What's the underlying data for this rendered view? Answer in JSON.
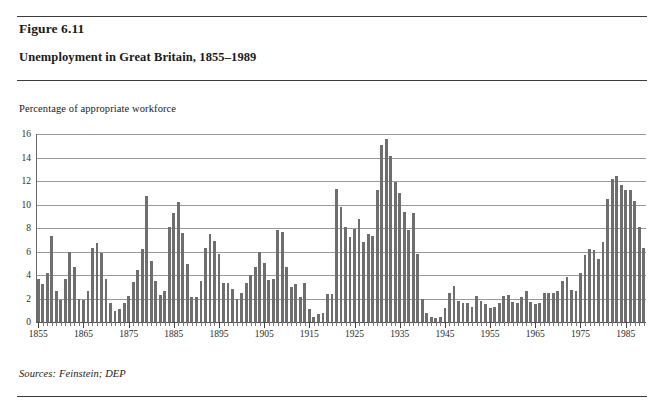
{
  "figure": {
    "number": "Figure 6.11",
    "title": "Unemployment in Great Britain, 1855–1989",
    "axis_note": "Percentage of appropriate workforce",
    "sources": "Sources: Feinstein; DEP"
  },
  "colors": {
    "bar": "#6e6e6e",
    "gridline": "#9a9a9a",
    "rule": "#3b3b3b",
    "text": "#1a1a1a",
    "background": "#ffffff"
  },
  "chart_data": {
    "type": "bar",
    "title": "Unemployment in Great Britain, 1855–1989",
    "subtitle": "Figure 6.11",
    "xlabel": "",
    "ylabel": "Percentage of appropriate workforce",
    "ylim": [
      0,
      16
    ],
    "ytick_step": 2,
    "yticks": [
      0,
      2,
      4,
      6,
      8,
      10,
      12,
      14,
      16
    ],
    "ytick_labels": [
      "0",
      "2",
      "4",
      "6",
      "8",
      "10",
      "12",
      "14",
      "16"
    ],
    "xlim": [
      1855,
      1989
    ],
    "xticks": [
      1855,
      1865,
      1875,
      1885,
      1895,
      1905,
      1915,
      1925,
      1935,
      1945,
      1955,
      1965,
      1975,
      1985
    ],
    "xtick_labels": [
      "1855",
      "1865",
      "1875",
      "1885",
      "1895",
      "1905",
      "1915",
      "1925",
      "1935",
      "1945",
      "1955",
      "1965",
      "1975",
      "1985"
    ],
    "xtick_minor_step": 1,
    "grid": "horizontal",
    "legend": "none",
    "series_name": "Unemployment rate",
    "x": [
      1855,
      1856,
      1857,
      1858,
      1859,
      1860,
      1861,
      1862,
      1863,
      1864,
      1865,
      1866,
      1867,
      1868,
      1869,
      1870,
      1871,
      1872,
      1873,
      1874,
      1875,
      1876,
      1877,
      1878,
      1879,
      1880,
      1881,
      1882,
      1883,
      1884,
      1885,
      1886,
      1887,
      1888,
      1889,
      1890,
      1891,
      1892,
      1893,
      1894,
      1895,
      1896,
      1897,
      1898,
      1899,
      1900,
      1901,
      1902,
      1903,
      1904,
      1905,
      1906,
      1907,
      1908,
      1909,
      1910,
      1911,
      1912,
      1913,
      1914,
      1915,
      1916,
      1917,
      1918,
      1919,
      1920,
      1921,
      1922,
      1923,
      1924,
      1925,
      1926,
      1927,
      1928,
      1929,
      1930,
      1931,
      1932,
      1933,
      1934,
      1935,
      1936,
      1937,
      1938,
      1939,
      1940,
      1941,
      1942,
      1943,
      1944,
      1945,
      1946,
      1947,
      1948,
      1949,
      1950,
      1951,
      1952,
      1953,
      1954,
      1955,
      1956,
      1957,
      1958,
      1959,
      1960,
      1961,
      1962,
      1963,
      1964,
      1965,
      1966,
      1967,
      1968,
      1969,
      1970,
      1971,
      1972,
      1973,
      1974,
      1975,
      1976,
      1977,
      1978,
      1979,
      1980,
      1981,
      1982,
      1983,
      1984,
      1985,
      1986,
      1987,
      1988,
      1989
    ],
    "values": [
      3.7,
      3.2,
      4.2,
      7.3,
      2.6,
      1.9,
      3.7,
      6.0,
      4.7,
      2.0,
      1.9,
      2.6,
      6.3,
      6.7,
      5.9,
      3.7,
      1.6,
      0.9,
      1.1,
      1.6,
      2.2,
      3.4,
      4.4,
      6.2,
      10.7,
      5.2,
      3.5,
      2.3,
      2.6,
      8.1,
      9.3,
      10.2,
      7.6,
      4.9,
      2.1,
      2.1,
      3.5,
      6.3,
      7.5,
      6.9,
      5.8,
      3.3,
      3.3,
      2.8,
      2.0,
      2.5,
      3.3,
      4.0,
      4.7,
      6.0,
      5.0,
      3.6,
      3.7,
      7.8,
      7.7,
      4.7,
      3.0,
      3.2,
      2.1,
      3.3,
      1.1,
      0.4,
      0.7,
      0.8,
      2.4,
      2.4,
      11.3,
      9.8,
      8.1,
      7.2,
      7.9,
      8.8,
      6.8,
      7.5,
      7.3,
      11.2,
      15.1,
      15.6,
      14.1,
      11.9,
      11.0,
      9.4,
      7.8,
      9.3,
      5.8,
      2.0,
      0.8,
      0.4,
      0.3,
      0.4,
      1.2,
      2.5,
      3.1,
      1.8,
      1.6,
      1.6,
      1.3,
      2.2,
      1.8,
      1.5,
      1.2,
      1.3,
      1.6,
      2.2,
      2.3,
      1.7,
      1.6,
      2.1,
      2.6,
      1.7,
      1.5,
      1.6,
      2.5,
      2.5,
      2.5,
      2.6,
      3.5,
      3.8,
      2.7,
      2.6,
      4.2,
      5.7,
      6.2,
      6.1,
      5.4,
      6.8,
      10.5,
      12.2,
      12.4,
      11.7,
      11.2,
      11.2,
      10.3,
      8.1,
      6.3
    ]
  }
}
